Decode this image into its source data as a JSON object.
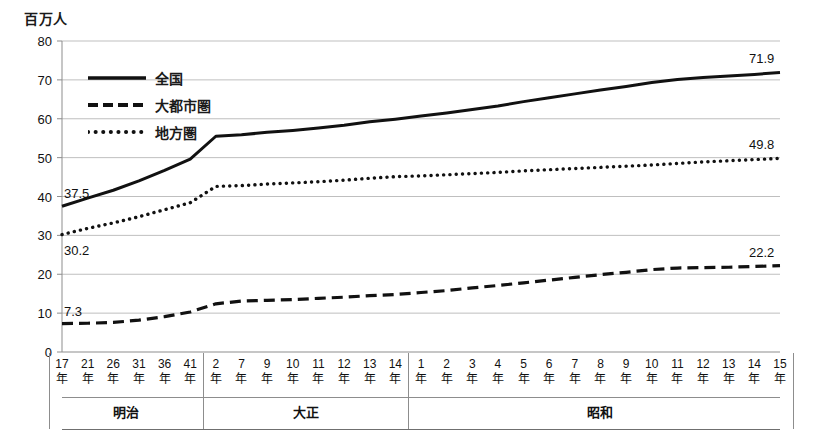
{
  "axis": {
    "unit_label": "百万人",
    "y_ticks": [
      80,
      70,
      60,
      50,
      40,
      30,
      20,
      10,
      0
    ],
    "y_min": 0,
    "y_max": 80
  },
  "legend": [
    {
      "label": "全国",
      "style": "solid",
      "key": "legend-key-solid"
    },
    {
      "label": "大都市圏",
      "style": "dashed",
      "key": "legend-key-dashed"
    },
    {
      "label": "地方圏",
      "style": "dotted",
      "key": "legend-key-dotted"
    }
  ],
  "eras": [
    {
      "name": "明治",
      "start_index": 0,
      "end_index": 5
    },
    {
      "name": "大正",
      "start_index": 6,
      "end_index": 13
    },
    {
      "name": "昭和",
      "start_index": 14,
      "end_index": 28
    }
  ],
  "annotations": [
    {
      "text": "37.5",
      "series": "全国",
      "at_index": 0,
      "position": "above-left"
    },
    {
      "text": "30.2",
      "series": "地方圏",
      "at_index": 0,
      "position": "below-left"
    },
    {
      "text": "7.3",
      "series": "大都市圏",
      "at_index": 0,
      "position": "above-left"
    },
    {
      "text": "71.9",
      "series": "全国",
      "at_index": 28,
      "position": "above-right"
    },
    {
      "text": "49.8",
      "series": "地方圏",
      "at_index": 28,
      "position": "above-right"
    },
    {
      "text": "22.2",
      "series": "大都市圏",
      "at_index": 28,
      "position": "above-right"
    }
  ],
  "caption": "",
  "colors": {
    "line": "#111111",
    "gridline": "#b8b8b8",
    "axis": "#8d8d8d",
    "background": "#ffffff"
  },
  "chart_data": {
    "type": "line",
    "title": "",
    "xlabel": "",
    "ylabel": "百万人",
    "ylim": [
      0,
      80
    ],
    "grid": true,
    "legend_position": "inside-top-left",
    "categories": [
      "17年",
      "21年",
      "26年",
      "31年",
      "36年",
      "41年",
      "2年",
      "7年",
      "9年",
      "10年",
      "11年",
      "12年",
      "13年",
      "14年",
      "1年",
      "2年",
      "3年",
      "4年",
      "5年",
      "6年",
      "7年",
      "8年",
      "9年",
      "10年",
      "11年",
      "12年",
      "13年",
      "14年",
      "15年"
    ],
    "era_labels": [
      "明治",
      "明治",
      "明治",
      "明治",
      "明治",
      "明治",
      "大正",
      "大正",
      "大正",
      "大正",
      "大正",
      "大正",
      "大正",
      "大正",
      "昭和",
      "昭和",
      "昭和",
      "昭和",
      "昭和",
      "昭和",
      "昭和",
      "昭和",
      "昭和",
      "昭和",
      "昭和",
      "昭和",
      "昭和",
      "昭和",
      "昭和"
    ],
    "series": [
      {
        "name": "全国",
        "style": "solid",
        "values": [
          37.5,
          39.6,
          41.6,
          44.0,
          46.7,
          49.6,
          55.5,
          55.9,
          56.5,
          57.0,
          57.6,
          58.3,
          59.2,
          59.9,
          60.7,
          61.5,
          62.4,
          63.3,
          64.4,
          65.4,
          66.4,
          67.4,
          68.3,
          69.3,
          70.1,
          70.6,
          71.0,
          71.4,
          71.9
        ]
      },
      {
        "name": "地方圏",
        "style": "dotted",
        "values": [
          30.2,
          31.8,
          33.2,
          34.8,
          36.6,
          38.4,
          42.6,
          42.8,
          43.2,
          43.5,
          43.8,
          44.2,
          44.7,
          45.1,
          45.3,
          45.6,
          45.9,
          46.2,
          46.6,
          46.9,
          47.2,
          47.5,
          47.8,
          48.1,
          48.5,
          48.9,
          49.2,
          49.5,
          49.8
        ]
      },
      {
        "name": "大都市圏",
        "style": "dashed",
        "values": [
          7.3,
          7.4,
          7.6,
          8.2,
          9.1,
          10.3,
          12.4,
          13.1,
          13.3,
          13.5,
          13.8,
          14.1,
          14.5,
          14.8,
          15.3,
          15.8,
          16.5,
          17.1,
          17.8,
          18.5,
          19.2,
          19.9,
          20.5,
          21.2,
          21.6,
          21.7,
          21.8,
          22.0,
          22.2
        ]
      }
    ]
  }
}
